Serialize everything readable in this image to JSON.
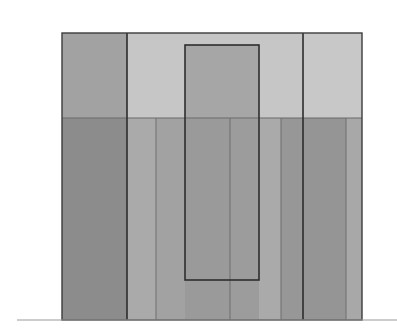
{
  "diagram": {
    "canvas": {
      "width": 397,
      "height": 335,
      "background": "#ffffff"
    },
    "baseline": {
      "x1": 17,
      "x2": 397,
      "y": 320,
      "color": "#9a9a9a"
    },
    "outer": {
      "x": 62,
      "y": 33,
      "width": 300,
      "height": 287,
      "stroke": "#3c3c3c"
    },
    "divider_y": 118,
    "top_regions": [
      {
        "name": "top-left",
        "x": 62,
        "width": 65,
        "fill": "#a2a2a2"
      },
      {
        "name": "top-middle",
        "x": 127,
        "width": 176,
        "fill": "#c6c6c6"
      },
      {
        "name": "top-right",
        "x": 303,
        "width": 59,
        "fill": "#c8c8c8"
      }
    ],
    "bottom_strips": [
      {
        "x": 62,
        "width": 65,
        "fill": "#8c8c8c"
      },
      {
        "x": 127,
        "width": 29,
        "fill": "#aaaaaa"
      },
      {
        "x": 156,
        "width": 29,
        "fill": "#a2a2a2"
      },
      {
        "x": 185,
        "width": 45,
        "fill": "#9a9a9a"
      },
      {
        "x": 230,
        "width": 29,
        "fill": "#9c9c9c"
      },
      {
        "x": 259,
        "width": 22,
        "fill": "#aaaaaa"
      },
      {
        "x": 281,
        "width": 22,
        "fill": "#979797"
      },
      {
        "x": 303,
        "width": 43,
        "fill": "#959595"
      },
      {
        "x": 346,
        "width": 16,
        "fill": "#a8a8a8"
      }
    ],
    "thick_lines": [
      127,
      303
    ],
    "thin_lines": [
      156,
      230,
      281,
      346
    ],
    "inner_rect": {
      "x": 185,
      "y": 45,
      "width": 74,
      "height": 235,
      "fill_top": "#a6a6a6",
      "stroke": "#2e2e2e"
    }
  }
}
